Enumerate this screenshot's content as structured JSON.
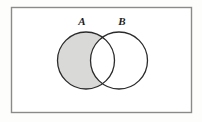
{
  "figure": {
    "kind": "venn-diagram",
    "caption": "",
    "background_color": "#fdfdfc"
  },
  "universe_box": {
    "label": "",
    "x": 11.5,
    "y": 7.5,
    "width": 180,
    "height": 105,
    "stroke_color": "#8a8a88",
    "stroke_width": 1.4,
    "fill_color": "#ffffff"
  },
  "sets": [
    {
      "id": "A",
      "label": "A",
      "cx": 86,
      "cy": 60.5,
      "r": 28.5,
      "stroke_color": "#2b2b2b",
      "stroke_width": 1.3,
      "fill_color": "#ffffff",
      "label_x": 82,
      "label_y": 25
    },
    {
      "id": "B",
      "label": "B",
      "cx": 119,
      "cy": 60.5,
      "r": 28.5,
      "stroke_color": "#2b2b2b",
      "stroke_width": 1.3,
      "fill_color": "#ffffff",
      "label_x": 122,
      "label_y": 25
    }
  ],
  "shaded_region": {
    "name": "A-minus-B",
    "description": "A only (A excluding the intersection with B)",
    "fill_color": "#d9d9d7",
    "includes_intersection": false
  },
  "regions": [
    {
      "name": "A-only",
      "shaded": true
    },
    {
      "name": "A-intersect-B",
      "shaded": false
    },
    {
      "name": "B-only",
      "shaded": false
    },
    {
      "name": "outside-A-and-B",
      "shaded": false
    }
  ]
}
